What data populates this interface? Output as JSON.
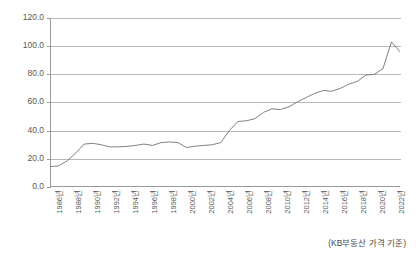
{
  "chart_data": {
    "type": "line",
    "title": "",
    "subtitle": "",
    "xlabel": "",
    "ylabel": "",
    "ylim": [
      0,
      120
    ],
    "ytick_step": 20,
    "grid": true,
    "legend": false,
    "legend_position": "none",
    "line_color": "#808080",
    "axis_color": "#9a9a9a",
    "grid_color": "#b9b9b9",
    "background": "#ffffff",
    "annotation": "(KB부동산 가격 기준)",
    "ytick_labels": [
      "120.0",
      "100.0",
      "80.0",
      "60.0",
      "40.0",
      "20.0",
      "0.0"
    ],
    "ytick_values": [
      120,
      100,
      80,
      60,
      40,
      20,
      0
    ],
    "xtick_labels": [
      "1986년",
      "1988년",
      "1990년",
      "1992년",
      "1994년",
      "1996년",
      "1998년",
      "2000년",
      "2002년",
      "2004년",
      "2006년",
      "2008년",
      "2010년",
      "2012년",
      "2014년",
      "2016년",
      "2018년",
      "2020년",
      "2022년"
    ],
    "categories": [
      "1986년",
      "1987년",
      "1988년",
      "1989년",
      "1990년",
      "1991년",
      "1992년",
      "1993년",
      "1994년",
      "1995년",
      "1996년",
      "1997년",
      "1998년",
      "1999년",
      "2000년",
      "2001년",
      "2002년",
      "2003년",
      "2004년",
      "2005년",
      "2006년",
      "2007년",
      "2008년",
      "2009년",
      "2010년",
      "2011년",
      "2012년",
      "2013년",
      "2014년",
      "2015년",
      "2016년",
      "2017년",
      "2018년",
      "2019년",
      "2020년",
      "2021년",
      "2022년",
      "2023년"
    ],
    "series": [
      {
        "name": "아파트 가격지수",
        "values": [
          14.5,
          15.0,
          18.5,
          24.0,
          30.5,
          31.0,
          30.0,
          28.5,
          28.5,
          28.8,
          29.5,
          30.5,
          29.5,
          31.5,
          32.0,
          31.5,
          28.0,
          29.0,
          29.5,
          30.0,
          31.5,
          40.0,
          46.5,
          47.0,
          48.5,
          53.0,
          55.5,
          55.0,
          57.0,
          60.5,
          63.5,
          66.5,
          68.5,
          68.0,
          70.0,
          73.0,
          75.0,
          79.5
        ]
      }
    ],
    "extended_values": [
      80.0,
      84.0,
      103.0,
      96.0
    ]
  }
}
